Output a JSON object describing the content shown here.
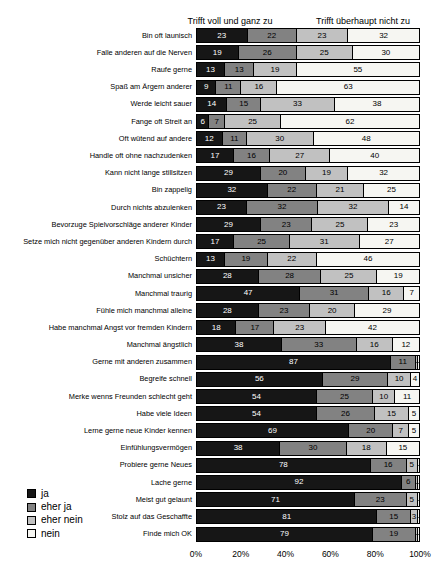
{
  "header": {
    "left_scale_label": "Trifft voll und ganz zu",
    "right_scale_label": "Trifft überhaupt nicht zu"
  },
  "legend": {
    "items": [
      {
        "key": "ja",
        "label": "ja",
        "color": "#161616"
      },
      {
        "key": "eher-ja",
        "label": "eher ja",
        "color": "#828282"
      },
      {
        "key": "eher-nein",
        "label": "eher nein",
        "color": "#c1c1c1"
      },
      {
        "key": "nein",
        "label": "nein",
        "color": "#f6f6f2"
      }
    ]
  },
  "axis": {
    "ticks": [
      "0%",
      "20%",
      "40%",
      "60%",
      "80%",
      "100%"
    ]
  },
  "chart_data": {
    "type": "bar",
    "orientation": "horizontal-stacked",
    "xlim": [
      0,
      100
    ],
    "xticks": [
      "0%",
      "20%",
      "40%",
      "60%",
      "80%",
      "100%"
    ],
    "top_left_header": "Trifft voll und ganz zu",
    "top_right_header": "Trifft überhaupt nicht zu",
    "legend_position": "bottom-left",
    "categories": [
      "Bin oft launisch",
      "Falle anderen auf die Nerven",
      "Raufe gerne",
      "Spaß am Ärgern anderer",
      "Werde leicht sauer",
      "Fange oft Streit an",
      "Oft wütend auf andere",
      "Handle oft ohne nachzudenken",
      "Kann nicht lange stillsitzen",
      "Bin zappelig",
      "Durch nichts abzulenken",
      "Bevorzuge Spielvorschläge anderer Kinder",
      "Setze mich nicht gegenüber anderen Kindern durch",
      "Schüchtern",
      "Manchmal unsicher",
      "Manchmal traurig",
      "Fühle mich manchmal alleine",
      "Habe manchmal Angst vor fremden Kindern",
      "Manchmal ängstlich",
      "Gerne mit anderen zusammen",
      "Begreife schnell",
      "Merke wenns Freunden schlecht geht",
      "Habe viele Ideen",
      "Lerne gerne neue Kinder kennen",
      "Einfühlungsvermögen",
      "Probiere gerne Neues",
      "Lache gerne",
      "Meist gut gelaunt",
      "Stolz auf das Geschaffte",
      "Finde mich OK"
    ],
    "series": [
      {
        "name": "ja",
        "key": "ja",
        "color": "#161616",
        "label_color": "#ffffff",
        "values": [
          23,
          19,
          13,
          9,
          14,
          6,
          12,
          17,
          29,
          32,
          23,
          29,
          17,
          13,
          28,
          47,
          28,
          18,
          38,
          87,
          56,
          54,
          54,
          69,
          38,
          78,
          92,
          71,
          81,
          79
        ]
      },
      {
        "name": "eher ja",
        "key": "eher-ja",
        "color": "#828282",
        "label_color": "#000000",
        "values": [
          22,
          26,
          13,
          11,
          15,
          7,
          11,
          16,
          20,
          22,
          32,
          23,
          25,
          19,
          28,
          31,
          23,
          17,
          33,
          11,
          29,
          25,
          26,
          20,
          30,
          16,
          6,
          23,
          15,
          19
        ]
      },
      {
        "name": "eher nein",
        "key": "eher-nein",
        "color": "#c1c1c1",
        "label_color": "#000000",
        "values": [
          23,
          25,
          19,
          16,
          33,
          25,
          30,
          27,
          19,
          21,
          32,
          25,
          31,
          22,
          25,
          16,
          20,
          23,
          16,
          1,
          10,
          10,
          15,
          7,
          18,
          5,
          1,
          5,
          3,
          1
        ]
      },
      {
        "name": "nein",
        "key": "nein",
        "color": "#f6f6f2",
        "label_color": "#000000",
        "values": [
          32,
          30,
          55,
          63,
          38,
          62,
          48,
          40,
          32,
          25,
          14,
          23,
          27,
          46,
          19,
          7,
          29,
          42,
          12,
          1,
          4,
          11,
          5,
          5,
          15,
          1,
          1,
          1,
          1,
          1
        ]
      }
    ]
  }
}
